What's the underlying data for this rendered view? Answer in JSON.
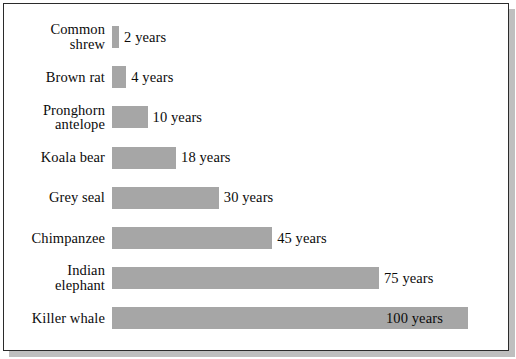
{
  "chart_data": {
    "type": "bar",
    "orientation": "horizontal",
    "title": "",
    "subtitle": "",
    "xlabel": "",
    "ylabel": "",
    "grid": false,
    "legend": null,
    "unit": "years",
    "xlim": [
      0,
      100
    ],
    "categories": [
      "Common\nshrew",
      "Brown rat",
      "Pronghorn\nantelope",
      "Koala bear",
      "Grey seal",
      "Chimpanzee",
      "Indian\nelephant",
      "Killer whale"
    ],
    "values": [
      2,
      4,
      10,
      18,
      30,
      45,
      75,
      100
    ],
    "data_labels": [
      "2 years",
      "4 years",
      "10 years",
      "18 years",
      "30 years",
      "45 years",
      "75 years",
      "100 years"
    ],
    "bar_color": "#a6a6a6",
    "text_color": "#0b0b0b",
    "background_color": "#ffffff",
    "border_color": "#2b2b2b"
  }
}
